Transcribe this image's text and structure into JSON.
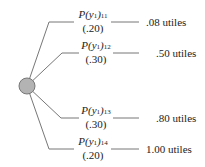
{
  "node": {
    "type": "chance-node",
    "fill": "#b3b3b3",
    "stroke": "#777777"
  },
  "branches": [
    {
      "label": "P(y1)11",
      "label_main": "P(y",
      "label_var_sub": "1",
      "label_close": ")",
      "label_sub": "11",
      "probability": "(.20)",
      "utility": ".08 utiles"
    },
    {
      "label": "P(y1)12",
      "label_main": "P(y",
      "label_var_sub": "1",
      "label_close": ")",
      "label_sub": "12",
      "probability": "(.30)",
      "utility": ".50 utiles"
    },
    {
      "label": "P(y1)13",
      "label_main": "P(y",
      "label_var_sub": "1",
      "label_close": ")",
      "label_sub": "13",
      "probability": "(.30)",
      "utility": ".80 utiles"
    },
    {
      "label": "P(y1)14",
      "label_main": "P(y",
      "label_var_sub": "1",
      "label_close": ")",
      "label_sub": "14",
      "probability": "(.20)",
      "utility": "1.00 utiles"
    }
  ]
}
